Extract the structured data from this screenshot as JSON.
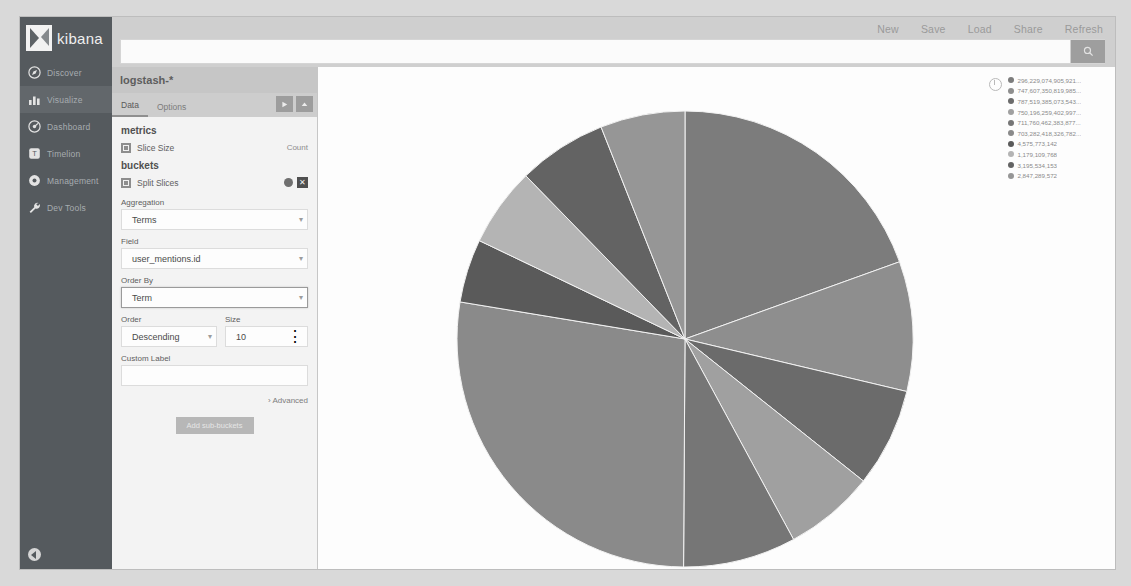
{
  "topbar": {
    "nav": [
      {
        "label": "New",
        "name": "new-button"
      },
      {
        "label": "Save",
        "name": "save-button"
      },
      {
        "label": "Load",
        "name": "load-button"
      },
      {
        "label": "Share",
        "name": "share-button"
      },
      {
        "label": "Refresh",
        "name": "refresh-button"
      }
    ],
    "search_value": "",
    "search_placeholder": "",
    "search_icon": "search-icon"
  },
  "sidebar": {
    "brand": "kibana",
    "items": [
      {
        "label": "Discover",
        "icon": "compass-icon",
        "active": false
      },
      {
        "label": "Visualize",
        "icon": "bar-chart-icon",
        "active": true
      },
      {
        "label": "Dashboard",
        "icon": "dashboard-icon",
        "active": false
      },
      {
        "label": "Timelion",
        "icon": "timelion-icon",
        "active": false
      },
      {
        "label": "Management",
        "icon": "gear-icon",
        "active": false
      },
      {
        "label": "Dev Tools",
        "icon": "wrench-icon",
        "active": false
      }
    ],
    "collapse_icon": "collapse-arrow-icon"
  },
  "editor": {
    "index_pattern": "logstash-*",
    "tabs": [
      {
        "label": "Data",
        "selected": true
      },
      {
        "label": "Options",
        "selected": false
      }
    ],
    "apply_icon": "play-icon",
    "collapse_icon": "caret-up-icon",
    "metrics_section": "metrics",
    "metric": {
      "label": "Slice Size",
      "value": "Count"
    },
    "buckets_section": "buckets",
    "bucket": {
      "label": "Split Slices",
      "eye_icon": "eye-icon",
      "remove_icon": "close-icon"
    },
    "fields": {
      "aggregation_label": "Aggregation",
      "aggregation_value": "Terms",
      "field_label": "Field",
      "field_value": "user_mentions.id",
      "order_by_label": "Order By",
      "order_by_value": "Term",
      "order_label": "Order",
      "order_value": "Descending",
      "size_label": "Size",
      "size_value": "10",
      "custom_label_label": "Custom Label",
      "custom_label_value": ""
    },
    "advanced_label": "Advanced",
    "add_sub_buckets_label": "Add sub-buckets"
  },
  "chart_data": {
    "type": "pie",
    "title": "",
    "legend_position": "right",
    "legend_toggle_icon": "legend-toggle-icon",
    "labels": [
      "296,229,074,905,921...",
      "747,607,350,819,985...",
      "787,519,385,073,543...",
      "750,196,259,402,997...",
      "711,760,462,383,877...",
      "703,282,418,326,782...",
      "4,575,773,142",
      "1,179,109,768",
      "3,195,534,153",
      "2,847,289,572"
    ],
    "values": [
      19.5,
      9.2,
      7.0,
      6.4,
      8.0,
      27.5,
      4.5,
      5.6,
      6.3,
      6.0
    ],
    "colors": [
      "#7c7c7c",
      "#8e8e8e",
      "#6b6b6b",
      "#a0a0a0",
      "#767676",
      "#8a8a8a",
      "#5a5a5a",
      "#b4b4b4",
      "#636363",
      "#969696"
    ],
    "slice_order_degrees_start": -90,
    "units": "count"
  }
}
